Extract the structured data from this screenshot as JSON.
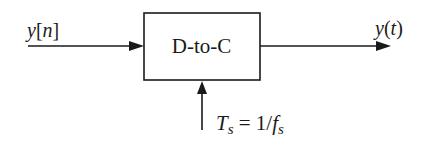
{
  "diagram": {
    "type": "block-diagram",
    "block": {
      "label": "D-to-C"
    },
    "input": {
      "signal_var": "y",
      "signal_open": "[",
      "signal_arg": "n",
      "signal_close": "]"
    },
    "output": {
      "signal_var": "y",
      "signal_open": "(",
      "signal_arg": "t",
      "signal_close": ")"
    },
    "control": {
      "lhs_var": "T",
      "lhs_sub": "s",
      "equals": " = 1/",
      "rhs_var": "f",
      "rhs_sub": "s"
    },
    "colors": {
      "stroke": "#1a1a1a",
      "background": "#ffffff"
    }
  }
}
